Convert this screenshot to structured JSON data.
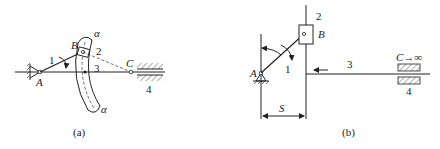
{
  "figure": {
    "panel_a": {
      "caption": "(a)",
      "labels": {
        "A": "A",
        "B": "B",
        "C": "C",
        "link1": "1",
        "link2": "2",
        "link3": "3",
        "link4": "4",
        "alpha_top": "α",
        "alpha_bottom": "α"
      }
    },
    "panel_b": {
      "caption": "(b)",
      "labels": {
        "A": "A",
        "B": "B",
        "C_inf": "C→∞",
        "link1": "1",
        "link2": "2",
        "link3": "3",
        "link4": "4",
        "S": "S"
      }
    },
    "colors": {
      "ink": "#222222",
      "background": "#ffffff"
    }
  }
}
